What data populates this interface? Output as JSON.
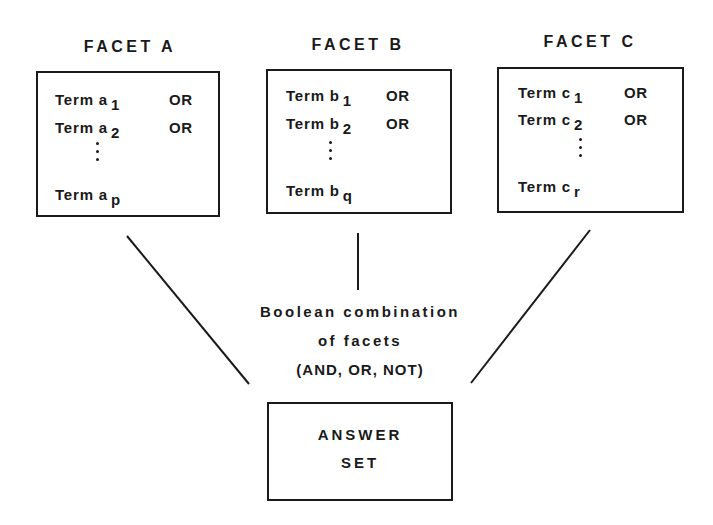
{
  "facets": [
    {
      "id": "a",
      "title": "FACET A",
      "terms": [
        {
          "label": "Term a",
          "sub": "1",
          "op": "OR"
        },
        {
          "label": "Term a",
          "sub": "2",
          "op": "OR"
        },
        {
          "label": "Term a",
          "sub": "p",
          "op": ""
        }
      ]
    },
    {
      "id": "b",
      "title": "FACET B",
      "terms": [
        {
          "label": "Term b",
          "sub": "1",
          "op": "OR"
        },
        {
          "label": "Term b",
          "sub": "2",
          "op": "OR"
        },
        {
          "label": "Term b",
          "sub": "q",
          "op": ""
        }
      ]
    },
    {
      "id": "c",
      "title": "FACET C",
      "terms": [
        {
          "label": "Term c",
          "sub": "1",
          "op": "OR"
        },
        {
          "label": "Term c",
          "sub": "2",
          "op": "OR"
        },
        {
          "label": "Term c",
          "sub": "r",
          "op": ""
        }
      ]
    }
  ],
  "combination": {
    "line1": "Boolean combination",
    "line2": "of facets",
    "line3": "(AND, OR, NOT)"
  },
  "answer": {
    "line1": "ANSWER",
    "line2": "SET"
  },
  "colors": {
    "ink": "#1a1a1a",
    "background": "#ffffff"
  }
}
